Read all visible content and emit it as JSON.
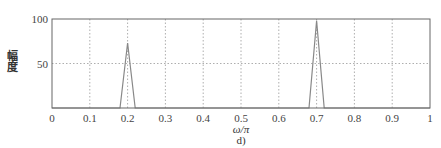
{
  "chart_data": {
    "type": "line",
    "title": "",
    "subtitle": "d)",
    "xlabel": "ω/π",
    "ylabel": "幅度",
    "xlim": [
      0,
      1
    ],
    "ylim": [
      0,
      100
    ],
    "xticks": [
      0,
      0.1,
      0.2,
      0.3,
      0.4,
      0.5,
      0.6,
      0.7,
      0.8,
      0.9,
      1
    ],
    "xtick_labels": [
      "0",
      "0.1",
      "0.2",
      "0.3",
      "0.4",
      "0.5",
      "0.6",
      "0.7",
      "0.8",
      "0.9",
      "1"
    ],
    "yticks": [
      50,
      100
    ],
    "ytick_labels": [
      "50",
      "100"
    ],
    "grid": true,
    "legend": null,
    "series": [
      {
        "name": "magnitude spectrum",
        "color": "#888888",
        "x": [
          0,
          0.18,
          0.2,
          0.22,
          0.68,
          0.7,
          0.72,
          1
        ],
        "y": [
          0,
          0,
          73,
          0,
          0,
          98,
          0,
          0
        ]
      }
    ]
  },
  "labels": {
    "ylabel": "幅度",
    "xlabel": "ω/π",
    "subplot": "d)"
  }
}
